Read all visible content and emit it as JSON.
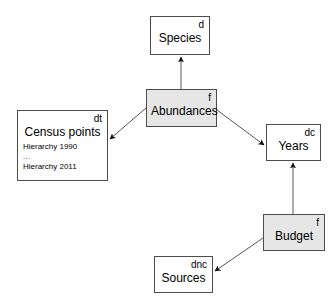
{
  "diagram": {
    "background_color": "#ffffff",
    "line_color": "#555555",
    "border_color": "#4d4d4d",
    "shaded_fill": "#e6e6e6",
    "plain_fill": "#ffffff",
    "nodes": [
      {
        "id": "species",
        "marker": "d",
        "title": "Species",
        "shaded": false,
        "rows": []
      },
      {
        "id": "abundances",
        "marker": "f",
        "title": "Abundances",
        "shaded": true,
        "rows": []
      },
      {
        "id": "census",
        "marker": "dt",
        "title": "Census points",
        "shaded": false,
        "rows": [
          "Hierarchy 1990",
          "...",
          "Hierarchy 2011"
        ]
      },
      {
        "id": "years",
        "marker": "dc",
        "title": "Years",
        "shaded": false,
        "rows": []
      },
      {
        "id": "budget",
        "marker": "f",
        "title": "Budget",
        "shaded": true,
        "rows": []
      },
      {
        "id": "sources",
        "marker": "dnc",
        "title": "Sources",
        "shaded": false,
        "rows": []
      }
    ],
    "edges": [
      {
        "id": "abundances-to-species",
        "from": "abundances",
        "to": "species",
        "arrowhead": "solid-triangle"
      },
      {
        "id": "abundances-to-census",
        "from": "abundances",
        "to": "census",
        "arrowhead": "solid-triangle"
      },
      {
        "id": "abundances-to-years",
        "from": "abundances",
        "to": "years",
        "arrowhead": "solid-triangle"
      },
      {
        "id": "budget-to-years",
        "from": "budget",
        "to": "years",
        "arrowhead": "solid-triangle"
      },
      {
        "id": "budget-to-sources",
        "from": "budget",
        "to": "sources",
        "arrowhead": "solid-triangle"
      }
    ]
  }
}
